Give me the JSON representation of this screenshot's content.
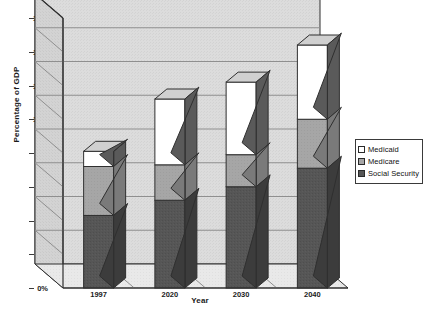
{
  "chart_data": {
    "type": "bar",
    "subtype": "stacked-3d-column",
    "title": "",
    "xlabel": "Year",
    "ylabel": "Percentage of GDP",
    "categories": [
      "1997",
      "2020",
      "2030",
      "2040"
    ],
    "ylim": [
      0,
      16
    ],
    "ytick_labels": [
      "0%",
      "2%",
      "4%",
      "6%",
      "8%",
      "10%",
      "12%",
      "14%",
      "16%"
    ],
    "ytick_values": [
      0,
      2,
      4,
      6,
      8,
      10,
      12,
      14,
      16
    ],
    "y_unit": "%",
    "grid": true,
    "grid_axis": "y",
    "legend_position": "right",
    "stack_order_bottom_to_top": [
      "Social Security",
      "Medicare",
      "Medicaid"
    ],
    "series": [
      {
        "name": "Social Security",
        "color": "#565656",
        "values": [
          4.3,
          5.2,
          6.0,
          7.1
        ]
      },
      {
        "name": "Medicare",
        "color": "#a6a6a6",
        "values": [
          2.9,
          2.1,
          1.9,
          2.9
        ]
      },
      {
        "name": "Medicaid",
        "color": "#ffffff",
        "values": [
          0.9,
          3.9,
          4.3,
          4.4
        ]
      }
    ],
    "totals": [
      8.1,
      11.2,
      12.2,
      14.4
    ],
    "cumulative_tops": {
      "Social Security": [
        4.3,
        5.2,
        6.0,
        7.1
      ],
      "Medicare": [
        7.2,
        7.3,
        7.9,
        10.0
      ],
      "Medicaid": [
        8.1,
        11.2,
        12.2,
        14.4
      ]
    }
  },
  "legend": {
    "items": [
      {
        "label": "Medicaid",
        "swatch": "white-swatch"
      },
      {
        "label": "Medicare",
        "swatch": "gray-swatch"
      },
      {
        "label": "Social Security",
        "swatch": "dark-gray-swatch"
      }
    ]
  },
  "axes": {
    "y_title": "Percentage of GDP",
    "x_title": "Year",
    "y_ticks": [
      "16%",
      "14%",
      "12%",
      "10%",
      "8%",
      "6%",
      "4%",
      "2%",
      "0%"
    ],
    "x_ticks": [
      "1997",
      "2020",
      "2030",
      "2040"
    ]
  },
  "colors": {
    "social_security": "#565656",
    "medicare": "#a6a6a6",
    "medicaid": "#ffffff",
    "wall_back": "#d8d8d8",
    "wall_side": "#cfcfcf",
    "floor": "#e8e8e8",
    "outline": "#2f2f2f",
    "gridline": "#8f8f8f",
    "background": "#ffffff"
  }
}
